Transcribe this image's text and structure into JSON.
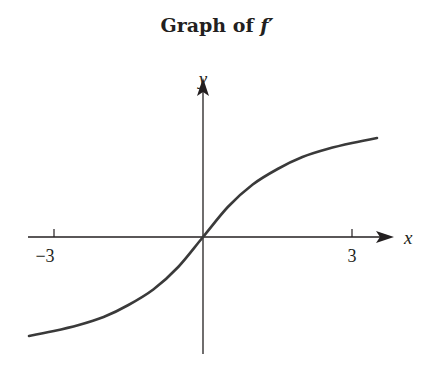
{
  "chart_data": {
    "type": "line",
    "title": "Graph of f′",
    "title_prefix": "Graph of ",
    "title_fn": "f′",
    "xlabel": "x",
    "ylabel": "y",
    "x_ticks": [
      -3,
      3
    ],
    "x_tick_labels": [
      "−3",
      "3"
    ],
    "xlim": [
      -3.5,
      3.6
    ],
    "ylim": [
      -2.3,
      3.1
    ],
    "grid": false,
    "legend": null,
    "series": [
      {
        "name": "f′",
        "x": [
          -3.5,
          -3,
          -2.5,
          -2,
          -1.5,
          -1,
          -0.5,
          0,
          0.5,
          1,
          1.5,
          2,
          2.5,
          3,
          3.5
        ],
        "y": [
          -1.98,
          -1.88,
          -1.76,
          -1.6,
          -1.36,
          -1.05,
          -0.6,
          0,
          0.6,
          1.05,
          1.36,
          1.6,
          1.76,
          1.88,
          1.98
        ]
      }
    ],
    "colors": {
      "curve": "#3a3a3a",
      "axes": "#231f20"
    }
  }
}
